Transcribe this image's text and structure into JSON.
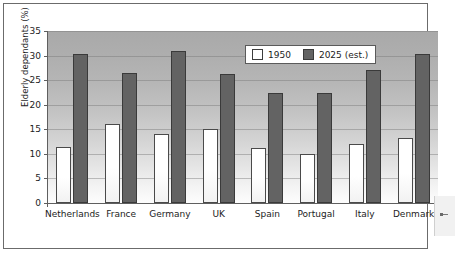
{
  "chart_data": {
    "type": "bar",
    "title": "",
    "xlabel": "",
    "ylabel": "Elderly dependants (%)",
    "ylim": [
      0,
      35
    ],
    "yticks": [
      0,
      5,
      10,
      15,
      20,
      25,
      30,
      35
    ],
    "grid": true,
    "legend_position": "top-right",
    "categories": [
      "Netherlands",
      "France",
      "Germany",
      "UK",
      "Spain",
      "Portugal",
      "Italy",
      "Denmark"
    ],
    "series": [
      {
        "name": "1950",
        "color": "#ffffff",
        "values": [
          11.3,
          16.1,
          14.1,
          15.0,
          11.2,
          10.0,
          12.0,
          13.2
        ]
      },
      {
        "name": "2025 (est.)",
        "color": "#636363",
        "values": [
          30.3,
          26.4,
          30.9,
          26.3,
          22.3,
          22.4,
          27.1,
          30.3
        ]
      }
    ]
  },
  "legend": {
    "items": [
      {
        "label": "1950",
        "swatch": "white-square-swatch"
      },
      {
        "label": "2025 (est.)",
        "swatch": "dark-gray-square-swatch"
      }
    ]
  },
  "colors": {
    "series_1950": "#ffffff",
    "series_2025": "#636363",
    "plot_background_top": "#a9a9a9",
    "plot_background_bottom": "#fdfdfd",
    "axis": "#5f5f5f",
    "frame": "#6b6b6b"
  }
}
